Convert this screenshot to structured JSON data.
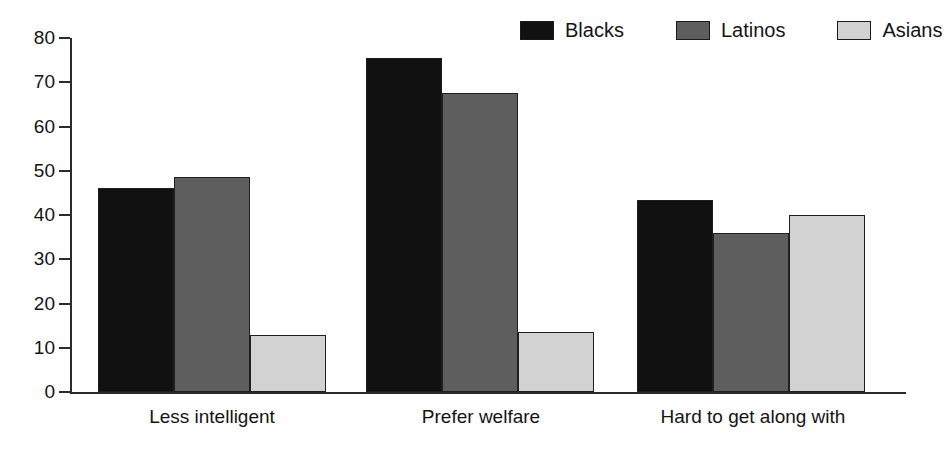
{
  "chart_data": {
    "type": "bar",
    "title": "",
    "xlabel": "",
    "ylabel": "",
    "ylim": [
      0,
      80
    ],
    "ytick_step": 10,
    "yticks": [
      0,
      10,
      20,
      30,
      40,
      50,
      60,
      70,
      80
    ],
    "grid": false,
    "legend_position": "top-right",
    "categories": [
      "Less intelligent",
      "Prefer welfare",
      "Hard to get along with"
    ],
    "series": [
      {
        "name": "Blacks",
        "color": "#111111",
        "values": [
          46,
          75.5,
          43.5
        ]
      },
      {
        "name": "Latinos",
        "color": "#5e5e5e",
        "values": [
          48.5,
          67.5,
          36
        ]
      },
      {
        "name": "Asians",
        "color": "#d2d2d2",
        "values": [
          12.8,
          13.5,
          40
        ]
      }
    ]
  },
  "axis": {
    "tick_labels": [
      "0",
      "10",
      "20",
      "30",
      "40",
      "50",
      "60",
      "70",
      "80"
    ]
  },
  "legend": {
    "entries": [
      {
        "label": "Blacks"
      },
      {
        "label": "Latinos"
      },
      {
        "label": "Asians"
      }
    ]
  }
}
